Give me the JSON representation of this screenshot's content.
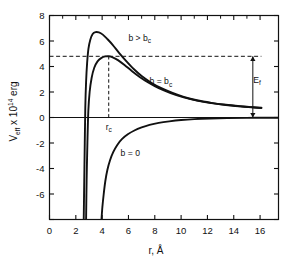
{
  "chart_data": {
    "type": "line",
    "title": "",
    "xlabel": "r, Å",
    "ylabel": "V_eff x 10^14 erg",
    "ylabel_parts": {
      "main": "V",
      "sub1": "eff",
      "mid": " x 10",
      "sup": "14",
      "tail": " erg"
    },
    "xlim": [
      0,
      17.4
    ],
    "ylim": [
      -8,
      8
    ],
    "xticks": [
      0,
      2,
      4,
      6,
      8,
      10,
      12,
      14,
      16
    ],
    "xticklabels": [
      "0",
      "2",
      "4",
      "6",
      "8",
      "10",
      "12",
      "14",
      "16"
    ],
    "yticks": [
      -8,
      -6,
      -4,
      -2,
      0,
      2,
      4,
      6,
      8
    ],
    "yticklabels": [
      "",
      "-6",
      "-4",
      "-2",
      "0",
      "2",
      "4",
      "6",
      "8"
    ],
    "grid": false,
    "legend_position": "inline-annotations",
    "zero_line": 0,
    "series": [
      {
        "name": "b > b_c",
        "label": "b > b",
        "label_sub": "c",
        "label_x": 6.0,
        "label_y": 6.0,
        "peak_x": 3.6,
        "peak_y": 6.7,
        "points": [
          [
            2.6,
            -8.0
          ],
          [
            2.64,
            -5.0
          ],
          [
            2.68,
            -2.0
          ],
          [
            2.72,
            0.8
          ],
          [
            2.78,
            2.8
          ],
          [
            2.86,
            4.3
          ],
          [
            2.96,
            5.4
          ],
          [
            3.1,
            6.1
          ],
          [
            3.28,
            6.55
          ],
          [
            3.5,
            6.7
          ],
          [
            3.75,
            6.68
          ],
          [
            4.05,
            6.5
          ],
          [
            4.4,
            6.15
          ],
          [
            4.8,
            5.7
          ],
          [
            5.3,
            5.05
          ],
          [
            5.85,
            4.4
          ],
          [
            6.4,
            3.8
          ],
          [
            7.0,
            3.25
          ],
          [
            7.7,
            2.75
          ],
          [
            8.5,
            2.3
          ],
          [
            9.3,
            1.95
          ],
          [
            10.2,
            1.62
          ],
          [
            11.2,
            1.35
          ],
          [
            12.3,
            1.15
          ],
          [
            13.4,
            1.0
          ],
          [
            14.5,
            0.88
          ],
          [
            15.5,
            0.8
          ],
          [
            16.1,
            0.76
          ]
        ]
      },
      {
        "name": "b = b_c",
        "label": "b = b",
        "label_sub": "c",
        "label_x": 7.6,
        "label_y": 2.6,
        "peak_x": 4.5,
        "peak_y": 4.8,
        "points": [
          [
            2.78,
            -8.0
          ],
          [
            2.82,
            -5.0
          ],
          [
            2.88,
            -2.0
          ],
          [
            2.95,
            0.5
          ],
          [
            3.05,
            2.0
          ],
          [
            3.2,
            3.1
          ],
          [
            3.4,
            3.9
          ],
          [
            3.65,
            4.4
          ],
          [
            3.95,
            4.68
          ],
          [
            4.25,
            4.79
          ],
          [
            4.5,
            4.8
          ],
          [
            4.8,
            4.72
          ],
          [
            5.2,
            4.5
          ],
          [
            5.7,
            4.12
          ],
          [
            6.25,
            3.65
          ],
          [
            6.85,
            3.18
          ],
          [
            7.5,
            2.75
          ],
          [
            8.3,
            2.3
          ],
          [
            9.2,
            1.92
          ],
          [
            10.2,
            1.58
          ],
          [
            11.2,
            1.32
          ],
          [
            12.3,
            1.13
          ],
          [
            13.4,
            0.98
          ],
          [
            14.5,
            0.87
          ],
          [
            15.5,
            0.79
          ],
          [
            16.1,
            0.75
          ]
        ]
      },
      {
        "name": "b = 0",
        "label": "b = 0",
        "label_sub": "",
        "label_x": 5.4,
        "label_y": -3.05,
        "points": [
          [
            3.95,
            -8.0
          ],
          [
            4.02,
            -7.0
          ],
          [
            4.12,
            -6.0
          ],
          [
            4.24,
            -5.0
          ],
          [
            4.4,
            -4.1
          ],
          [
            4.6,
            -3.35
          ],
          [
            4.85,
            -2.7
          ],
          [
            5.15,
            -2.15
          ],
          [
            5.5,
            -1.7
          ],
          [
            5.95,
            -1.32
          ],
          [
            6.45,
            -1.02
          ],
          [
            7.0,
            -0.78
          ],
          [
            7.6,
            -0.58
          ],
          [
            8.3,
            -0.42
          ],
          [
            9.1,
            -0.3
          ],
          [
            10.0,
            -0.2
          ],
          [
            11.0,
            -0.13
          ],
          [
            12.2,
            -0.08
          ],
          [
            13.5,
            -0.05
          ],
          [
            15.0,
            -0.03
          ],
          [
            16.6,
            -0.02
          ],
          [
            17.4,
            -0.02
          ]
        ]
      }
    ],
    "annotations": [
      {
        "name": "dashed-energy-level",
        "type": "hline-dashed",
        "y": 4.8,
        "x_from": 0.0,
        "x_to": 16.1
      },
      {
        "name": "dashed-rc-line",
        "type": "vline-dashed",
        "x": 4.5,
        "y_from": 0.0,
        "y_to": 4.8
      },
      {
        "name": "rc-label",
        "type": "text",
        "text": "r",
        "sub": "c",
        "x": 4.5,
        "y": -0.95
      },
      {
        "name": "ef-label",
        "type": "text",
        "text": "E",
        "sub": "f",
        "x": 16.05,
        "y": 2.7
      },
      {
        "name": "ef-arrow",
        "type": "double-arrow-vertical",
        "x": 15.45,
        "y_from": 0.0,
        "y_to": 4.8
      }
    ]
  }
}
